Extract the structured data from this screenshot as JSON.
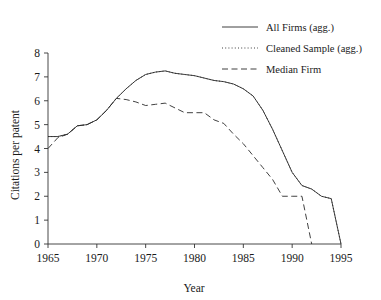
{
  "chart_data": {
    "type": "line",
    "title": "",
    "xlabel": "Year",
    "ylabel": "Citations per patent",
    "xlim": [
      1965,
      1995
    ],
    "ylim": [
      0,
      8
    ],
    "xticks": [
      1965,
      1970,
      1975,
      1980,
      1985,
      1990,
      1995
    ],
    "yticks": [
      0,
      1,
      2,
      3,
      4,
      5,
      6,
      7,
      8
    ],
    "grid": false,
    "legend_position": "top-right",
    "line_color": "#2b2b2b",
    "background": "#ffffff",
    "x": [
      1965,
      1966,
      1967,
      1968,
      1969,
      1970,
      1971,
      1972,
      1973,
      1974,
      1975,
      1976,
      1977,
      1978,
      1979,
      1980,
      1981,
      1982,
      1983,
      1984,
      1985,
      1986,
      1987,
      1988,
      1989,
      1990,
      1991,
      1992,
      1993,
      1994,
      1995
    ],
    "series": [
      {
        "name": "All Firms (agg.)",
        "style": "solid",
        "values": [
          4.5,
          4.5,
          4.6,
          4.95,
          5.0,
          5.2,
          5.6,
          6.1,
          6.5,
          6.85,
          7.1,
          7.2,
          7.25,
          7.15,
          7.1,
          7.05,
          6.95,
          6.85,
          6.8,
          6.7,
          6.5,
          6.2,
          5.6,
          4.8,
          3.9,
          3.0,
          2.45,
          2.3,
          2.0,
          1.9,
          0.0
        ]
      },
      {
        "name": "Cleaned Sample (agg.)",
        "style": "dotted",
        "values": [
          4.5,
          4.5,
          4.6,
          4.95,
          5.0,
          5.2,
          5.6,
          6.1,
          6.5,
          6.85,
          7.1,
          7.2,
          7.25,
          7.15,
          7.1,
          7.05,
          6.95,
          6.85,
          6.8,
          6.7,
          6.5,
          6.2,
          5.6,
          4.8,
          3.9,
          3.0,
          2.45,
          2.3,
          2.0,
          1.9,
          0.0
        ]
      },
      {
        "name": "Median Firm",
        "style": "dashed",
        "values": [
          4.0,
          4.45,
          4.6,
          4.95,
          5.0,
          5.2,
          5.6,
          6.1,
          6.05,
          5.95,
          5.8,
          5.85,
          5.9,
          5.7,
          5.5,
          5.5,
          5.5,
          5.2,
          5.05,
          4.6,
          4.2,
          3.7,
          3.2,
          2.7,
          2.0,
          2.0,
          2.0,
          0.0,
          null,
          null,
          null
        ]
      }
    ]
  },
  "axes": {
    "y_tick_labels": [
      "8",
      "7",
      "6",
      "5",
      "4",
      "3",
      "2",
      "1",
      "0"
    ],
    "x_tick_labels": [
      "1965",
      "1970",
      "1975",
      "1980",
      "1985",
      "1990",
      "1995"
    ],
    "x_title": "Year",
    "y_title": "Citations per patent"
  },
  "legend": {
    "items": [
      {
        "label": "All Firms (agg.)",
        "style": "solid"
      },
      {
        "label": "Cleaned Sample (agg.)",
        "style": "dotted"
      },
      {
        "label": "Median Firm",
        "style": "dashed"
      }
    ]
  }
}
